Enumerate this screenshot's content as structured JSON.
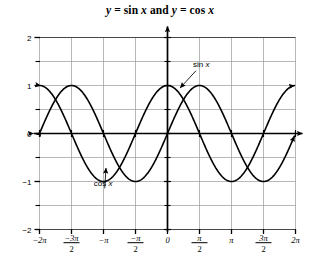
{
  "chart_data": {
    "type": "line",
    "title": "y = sin x and y = cos x",
    "title_parts": {
      "y1": "y",
      "eq1": " = sin ",
      "x1": "x",
      "and": " and ",
      "y2": "y",
      "eq2": " = cos ",
      "x2": "x"
    },
    "xlabel": "",
    "ylabel": "",
    "xlim": [
      -6.283185307,
      6.283185307
    ],
    "ylim": [
      -2,
      2
    ],
    "grid": true,
    "grid_x_step": 1.570796327,
    "grid_y_step": 0.5,
    "x_tick_values": [
      -6.283185307,
      -4.71238898,
      -3.141592654,
      -1.570796327,
      0,
      1.570796327,
      3.141592654,
      4.71238898,
      6.283185307
    ],
    "x_tick_labels": [
      "-2π",
      "-3π/2",
      "-π",
      "-π/2",
      "0",
      "π/2",
      "π",
      "3π/2",
      "2π"
    ],
    "x_tick_labels_display": [
      {
        "kind": "plain",
        "text": "−2π"
      },
      {
        "kind": "fraction",
        "num": "−3π",
        "den": "2"
      },
      {
        "kind": "plain",
        "text": "−π"
      },
      {
        "kind": "fraction",
        "num": "−π",
        "den": "2"
      },
      {
        "kind": "plain",
        "text": "0"
      },
      {
        "kind": "fraction",
        "num": "π",
        "den": "2"
      },
      {
        "kind": "plain",
        "text": "π"
      },
      {
        "kind": "fraction",
        "num": "3π",
        "den": "2"
      },
      {
        "kind": "plain",
        "text": "2π"
      }
    ],
    "y_tick_values": [
      2,
      1,
      0,
      -1,
      -2
    ],
    "y_tick_labels": [
      "2",
      "1",
      "0",
      "-1",
      "-2"
    ],
    "y_tick_labels_display": [
      "2",
      "1",
      "0",
      "−1",
      "−2"
    ],
    "y_minor_tick_values": [
      1.5,
      0.5,
      -0.5,
      -1.5
    ],
    "series": [
      {
        "name": "sin x",
        "label": "sin x",
        "label_parts": {
          "fn": "sin ",
          "var": "x"
        },
        "function": "sin",
        "amplitude": 1,
        "period": 6.283185307,
        "phase": 0,
        "color": "#000000",
        "linewidth": 1.6,
        "arrow_start": true,
        "arrow_end": true,
        "annotation": {
          "text": "sin x",
          "text_x": 1.25,
          "text_y": 1.38,
          "leader_to_x": 0.62,
          "leader_to_y": 0.95
        },
        "key_points": [
          {
            "x": -6.283185307,
            "y": 0
          },
          {
            "x": -4.71238898,
            "y": -1
          },
          {
            "x": -3.141592654,
            "y": 0
          },
          {
            "x": -1.570796327,
            "y": 1
          },
          {
            "x": 0,
            "y": 0
          },
          {
            "x": 1.570796327,
            "y": 1
          },
          {
            "x": 3.141592654,
            "y": 0
          },
          {
            "x": 4.71238898,
            "y": -1
          },
          {
            "x": 6.283185307,
            "y": 0
          }
        ]
      },
      {
        "name": "cos x",
        "label": "cos x",
        "label_parts": {
          "fn": "cos ",
          "var": "x"
        },
        "function": "cos",
        "amplitude": 1,
        "period": 6.283185307,
        "phase": 1.570796327,
        "color": "#000000",
        "linewidth": 1.6,
        "arrow_start": true,
        "arrow_end": true,
        "annotation": {
          "text": "cos x",
          "text_x": -3.62,
          "text_y": -1.09,
          "leader_to_x": -3.02,
          "leader_to_y": -0.72
        },
        "key_points": [
          {
            "x": -6.283185307,
            "y": 1
          },
          {
            "x": -4.71238898,
            "y": 0
          },
          {
            "x": -3.141592654,
            "y": -1
          },
          {
            "x": -1.570796327,
            "y": 0
          },
          {
            "x": 0,
            "y": 1
          },
          {
            "x": 1.570796327,
            "y": 0
          },
          {
            "x": 3.141592654,
            "y": -1
          },
          {
            "x": 4.71238898,
            "y": 0
          },
          {
            "x": 6.283185307,
            "y": 1
          }
        ]
      }
    ],
    "axes": {
      "x_axis_arrow_left": true,
      "x_axis_arrow_right": true,
      "y_axis_arrow_up": true,
      "origin_label": "0"
    }
  }
}
